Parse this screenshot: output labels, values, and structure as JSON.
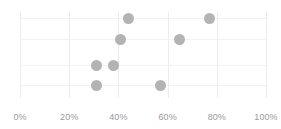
{
  "chart_data": {
    "type": "scatter",
    "title": "",
    "subtitle": "",
    "xlabel": "",
    "ylabel": "",
    "xlim": [
      0,
      100
    ],
    "ylim": [
      0,
      4
    ],
    "grid": true,
    "legend": null,
    "x_tick_labels": [
      "0%",
      "20%",
      "40%",
      "60%",
      "80%",
      "100%"
    ],
    "x_tick_values": [
      0,
      20,
      40,
      60,
      80,
      100
    ],
    "y_tick_labels": [],
    "y_gridline_values": [
      1,
      2,
      3,
      4
    ],
    "marker_color": "#b3b3b3",
    "gridline_color": "#ececec",
    "tick_label_color": "#9a9a9a",
    "background_color": "#ffffff",
    "points": [
      {
        "x": 44,
        "y": 4,
        "label": "44%"
      },
      {
        "x": 77,
        "y": 4,
        "label": "77%"
      },
      {
        "x": 41,
        "y": 3,
        "label": "41%"
      },
      {
        "x": 65,
        "y": 3,
        "label": "65%"
      },
      {
        "x": 31,
        "y": 2,
        "label": "31%"
      },
      {
        "x": 38,
        "y": 2,
        "label": "38%"
      },
      {
        "x": 31,
        "y": 1,
        "label": "31%"
      },
      {
        "x": 57,
        "y": 1,
        "label": "57%"
      }
    ]
  },
  "axis": {
    "x_ticks": [
      {
        "label": "0%",
        "value": 0
      },
      {
        "label": "20%",
        "value": 20
      },
      {
        "label": "40%",
        "value": 40
      },
      {
        "label": "60%",
        "value": 60
      },
      {
        "label": "80%",
        "value": 80
      },
      {
        "label": "100%",
        "value": 100
      }
    ]
  }
}
